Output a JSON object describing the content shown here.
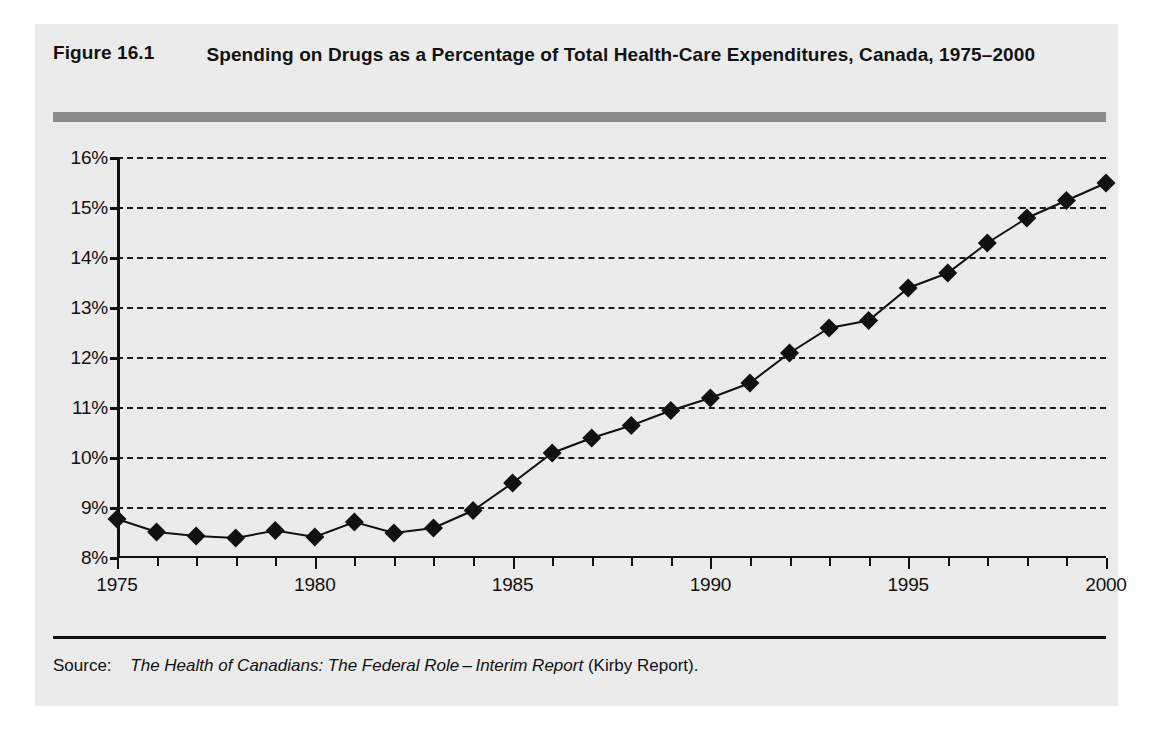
{
  "figure": {
    "label": "Figure 16.1",
    "title": "Spending on Drugs as a Percentage of Total Health-Care Expenditures, Canada, 1975–2000",
    "rule_color": "#8c8c8c",
    "panel_background": "#ebebeb"
  },
  "source": {
    "label": "Source:",
    "title": "The Health of Canadians: The Federal Role – Interim Report",
    "suffix": "(Kirby Report)."
  },
  "chart_data": {
    "type": "line",
    "title": "Spending on Drugs as a Percentage of Total Health-Care Expenditures, Canada, 1975–2000",
    "xlabel": "",
    "ylabel": "",
    "xlim": [
      1975,
      2000
    ],
    "ylim": [
      8,
      16
    ],
    "grid": "horizontal-dashed",
    "legend": "none",
    "marker": "diamond",
    "marker_color": "#111111",
    "line_color": "#111111",
    "ytick_labels": [
      "16%",
      "15%",
      "14%",
      "13%",
      "12%",
      "11%",
      "10%",
      "9%",
      "8%"
    ],
    "yticks": [
      16,
      15,
      14,
      13,
      12,
      11,
      10,
      9,
      8
    ],
    "xtick_labels": [
      "1975",
      "1980",
      "1985",
      "1990",
      "1995",
      "2000"
    ],
    "xticks": [
      1975,
      1980,
      1985,
      1990,
      1995,
      2000
    ],
    "x": [
      1975,
      1976,
      1977,
      1978,
      1979,
      1980,
      1981,
      1982,
      1983,
      1984,
      1985,
      1986,
      1987,
      1988,
      1989,
      1990,
      1991,
      1992,
      1993,
      1994,
      1995,
      1996,
      1997,
      1998,
      1999,
      2000
    ],
    "values": [
      8.78,
      8.52,
      8.44,
      8.4,
      8.55,
      8.42,
      8.72,
      8.5,
      8.6,
      8.95,
      9.5,
      10.1,
      10.4,
      10.65,
      10.95,
      11.2,
      11.5,
      12.1,
      12.6,
      12.75,
      13.4,
      13.7,
      14.3,
      14.8,
      15.15,
      15.5
    ],
    "series_name": "Drug spending share of total health-care expenditures (%)"
  }
}
